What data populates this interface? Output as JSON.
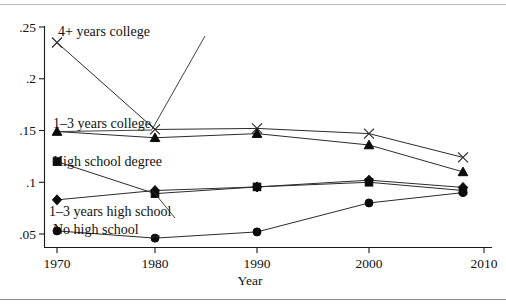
{
  "chart_data": {
    "type": "line",
    "title": "",
    "subtitle": "",
    "xlabel": "Year",
    "ylabel": "",
    "xlim": [
      1967,
      2011
    ],
    "ylim": [
      0.043,
      0.253
    ],
    "grid": false,
    "legend_position": "inline-labels",
    "x": [
      1970,
      1980,
      1990,
      2000,
      2008
    ],
    "xticks": [
      "1970",
      "1980",
      "1990",
      "2000",
      "2010"
    ],
    "xtick_values": [
      1970,
      1980,
      1990,
      2000,
      2010
    ],
    "yticks": [
      ".05",
      ".1",
      ".15",
      ".2",
      ".25"
    ],
    "ytick_values": [
      0.05,
      0.1,
      0.15,
      0.2,
      0.25
    ],
    "series": [
      {
        "name": "4+ years college",
        "marker": "x-marker",
        "label": "4+ years college",
        "values": [
          0.235,
          0.151,
          0.152,
          0.147,
          0.124
        ]
      },
      {
        "name": "1-3 years college",
        "marker": "triangle-marker",
        "label": "1–3 years college",
        "values": [
          0.149,
          0.143,
          0.147,
          0.136,
          0.11
        ]
      },
      {
        "name": "High school degree",
        "marker": "square-marker",
        "label": "High school degree",
        "values": [
          0.12,
          0.089,
          0.0955,
          0.1,
          0.092
        ]
      },
      {
        "name": "1-3 years high school",
        "marker": "diamond-marker",
        "label": "1–3 years high school",
        "values": [
          0.083,
          0.092,
          0.0955,
          0.102,
          0.095
        ]
      },
      {
        "name": "No high school",
        "marker": "circle-marker",
        "label": "No high school",
        "values": [
          0.053,
          0.046,
          0.052,
          0.08,
          0.09
        ]
      }
    ],
    "annotations": [
      {
        "text": "4+ years college",
        "series": "4+ years college"
      },
      {
        "text": "1–3 years college",
        "series": "1-3 years college"
      },
      {
        "text": "High school degree",
        "series": "High school degree"
      },
      {
        "text": "1–3 years high school",
        "series": "1-3 years high school"
      },
      {
        "text": "No high school",
        "series": "No high school"
      }
    ],
    "colors": {
      "line": "#2b2b2b",
      "marker": "#0b0b0b",
      "axis": "#1a1a1a",
      "text": "#111111",
      "background": "#ffffff"
    }
  }
}
